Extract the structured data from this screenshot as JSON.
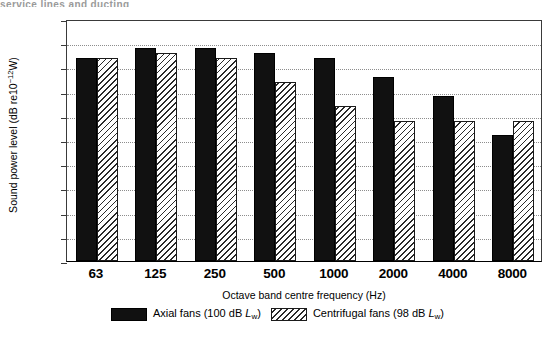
{
  "page": {
    "top_caption_fragment": "service lines and ducting"
  },
  "chart_data": {
    "type": "bar",
    "title": "",
    "xlabel": "Octave band centre frequency (Hz)",
    "ylabel": "Sound power level (dB re10⁻¹²W)",
    "ylabel_parts": {
      "prefix": "Sound power level (dB re10",
      "exponent": "−12",
      "suffix": "W)"
    },
    "categories": [
      "63",
      "125",
      "250",
      "500",
      "1000",
      "2000",
      "4000",
      "8000"
    ],
    "ylim": [
      50,
      100
    ],
    "yticks": [
      50,
      55,
      60,
      65,
      70,
      75,
      80,
      85,
      90,
      95,
      100
    ],
    "grid": true,
    "grid_style": "dotted-horizontal",
    "legend_position": "bottom-center",
    "series": [
      {
        "name": "Axial fans (100 dB Lw)",
        "name_parts": {
          "text_before": "Axial fans (100 dB ",
          "symbol": "L",
          "subscript": "w",
          "text_after": ")"
        },
        "fill": "solid-black",
        "color": "#111111",
        "values": [
          92,
          94,
          94,
          93,
          92,
          88,
          84,
          76
        ]
      },
      {
        "name": "Centrifugal fans (98 dB Lw)",
        "name_parts": {
          "text_before": "Centrifugal fans (98 dB ",
          "symbol": "L",
          "subscript": "w",
          "text_after": ")"
        },
        "fill": "diagonal-hatch",
        "color": "#ffffff",
        "values": [
          92,
          93,
          92,
          87,
          82,
          79,
          79,
          79
        ]
      }
    ]
  }
}
